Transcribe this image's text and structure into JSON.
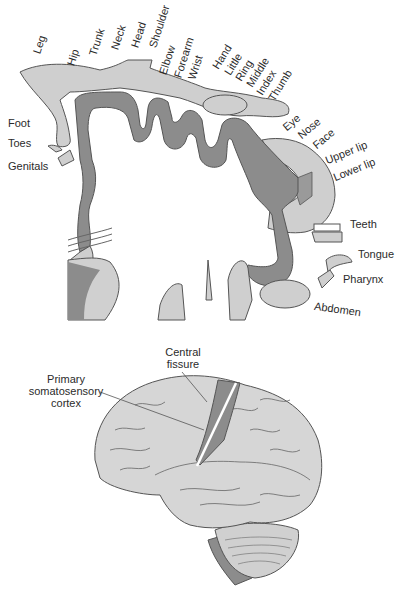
{
  "figure": {
    "top_diagram": {
      "name": "sensory homunculus",
      "labels_top": [
        "Leg",
        "Hip",
        "Trunk",
        "Neck",
        "Head",
        "Shoulder",
        "Elbow",
        "Forearm",
        "Wrist",
        "Hand",
        "Little",
        "Ring",
        "Middle",
        "Index",
        "Thumb"
      ],
      "labels_right": [
        "Eye",
        "Nose",
        "Face",
        "Upper lip",
        "Lower lip",
        "Teeth",
        "Tongue",
        "Pharynx",
        "Abdomen"
      ],
      "labels_left": [
        "Foot",
        "Toes",
        "Genitals"
      ]
    },
    "bottom_diagram": {
      "name": "lateral brain view",
      "label_central_fissure": "Central fissure",
      "label_central_fissure_line1": "Central",
      "label_central_fissure_line2": "fissure",
      "label_cortex_line1": "Primary",
      "label_cortex_line2": "somatosensory",
      "label_cortex_line3": "cortex"
    },
    "colors": {
      "cortex_dark": "#8c8c8c",
      "body_light": "#cfcfcf",
      "brain_fill": "#d6d6d6",
      "outline": "#555555"
    }
  }
}
